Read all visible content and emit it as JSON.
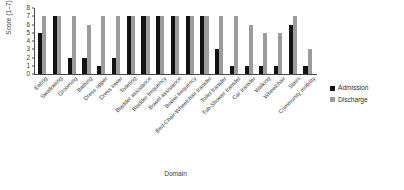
{
  "chart_data": {
    "type": "bar",
    "title": "",
    "xlabel": "Domain",
    "ylabel": "Score (1–7)",
    "ylim": [
      0,
      8
    ],
    "yticks": [
      0,
      1,
      2,
      3,
      4,
      5,
      6,
      7,
      8
    ],
    "grid": false,
    "legend_position": "right",
    "categories": [
      "Eating",
      "Swallowing",
      "Grooming",
      "Bathing",
      "Dress upper",
      "Dress lower",
      "Toileting",
      "Bladder assistance",
      "Bladder frequency",
      "Bowel assistance",
      "Bowel frequency",
      "Bed-Chair-Wheelchair transfer",
      "Toilet transfer",
      "Tub-Shower transfer",
      "Car transfer",
      "Walking",
      "Wheelchair",
      "Stairs",
      "Community mobility"
    ],
    "series": [
      {
        "name": "Admission",
        "color": "#121212",
        "values": [
          5,
          7,
          2,
          2,
          1,
          2,
          7,
          7,
          7,
          7,
          7,
          7,
          3,
          1,
          1,
          1,
          1,
          6,
          1
        ]
      },
      {
        "name": "Discharge",
        "color": "#9c9c9c",
        "values": [
          7,
          7,
          7,
          6,
          7,
          7,
          7,
          7,
          7,
          7,
          7,
          7,
          7,
          7,
          6,
          5,
          5,
          7,
          3
        ]
      }
    ]
  },
  "legend": {
    "items": [
      {
        "label": "Admission",
        "series": "admission"
      },
      {
        "label": "Discharge",
        "series": "discharge"
      }
    ]
  }
}
